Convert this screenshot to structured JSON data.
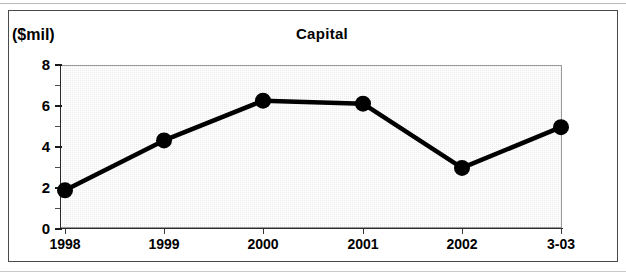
{
  "figure": {
    "title": "Capital",
    "units_label": "($mil)"
  },
  "chart_data": {
    "type": "line",
    "title": "Capital",
    "xlabel": "",
    "ylabel": "($mil)",
    "categories": [
      "1998",
      "1999",
      "2000",
      "2001",
      "2002",
      "3-03"
    ],
    "values": [
      1.85,
      4.3,
      6.25,
      6.1,
      2.95,
      4.95
    ],
    "series": [
      {
        "name": "Capital",
        "values": [
          1.85,
          4.3,
          6.25,
          6.1,
          2.95,
          4.95
        ]
      }
    ],
    "ylim": [
      0,
      8
    ],
    "ytick_labels": [
      "0",
      "2",
      "4",
      "6",
      "8"
    ],
    "ytick_values": [
      0,
      2,
      4,
      6,
      8
    ],
    "yminor_tick_values": [
      1,
      3,
      5,
      7
    ],
    "grid": false,
    "legend": "none",
    "marker": "filled-circle",
    "line_color": "#000000",
    "plot_background": "#ececec"
  },
  "axis": {
    "y_labels": [
      "8",
      "6",
      "4",
      "2",
      "0"
    ],
    "x_labels": [
      "1998",
      "1999",
      "2000",
      "2001",
      "2002",
      "3-03"
    ]
  }
}
